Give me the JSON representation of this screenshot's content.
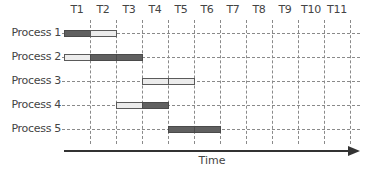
{
  "diagram": {
    "type": "gantt-timeline",
    "columns": [
      "T1",
      "T2",
      "T3",
      "T4",
      "T5",
      "T6",
      "T7",
      "T8",
      "T9",
      "T10",
      "T11"
    ],
    "rows": [
      {
        "label": "Process 1",
        "segments": [
          {
            "slot": 1,
            "style": "dark"
          },
          {
            "slot": 2,
            "style": "light"
          }
        ]
      },
      {
        "label": "Process 2",
        "segments": [
          {
            "slot": 1,
            "style": "light"
          },
          {
            "slot": 2,
            "style": "dark"
          },
          {
            "slot": 3,
            "style": "dark"
          }
        ]
      },
      {
        "label": "Process 3",
        "segments": [
          {
            "slot": 4,
            "style": "light"
          },
          {
            "slot": 5,
            "style": "light"
          }
        ]
      },
      {
        "label": "Process 4",
        "segments": [
          {
            "slot": 3,
            "style": "light"
          },
          {
            "slot": 4,
            "style": "dark"
          }
        ]
      },
      {
        "label": "Process 5",
        "segments": [
          {
            "slot": 5,
            "style": "dark"
          },
          {
            "slot": 6,
            "style": "dark"
          }
        ]
      }
    ],
    "axis_label": "Time",
    "colors": {
      "dark": "#606060",
      "light": "#ececec",
      "grid": "#8a8a8a",
      "axis": "#333333"
    }
  }
}
